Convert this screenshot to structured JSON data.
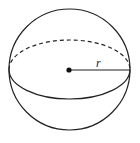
{
  "diagram": {
    "radius_label": "r",
    "colors": {
      "stroke": "#222222",
      "background": "#ffffff"
    }
  }
}
